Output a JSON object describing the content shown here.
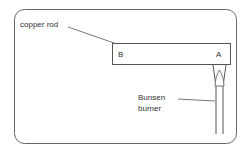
{
  "diagram": {
    "labels": {
      "copper_rod": "copper rod",
      "end_b": "B",
      "end_a": "A",
      "bunsen_line1": "Bunsen",
      "bunsen_line2": "burner"
    },
    "colors": {
      "stroke": "#555555",
      "background": "#ffffff"
    }
  }
}
